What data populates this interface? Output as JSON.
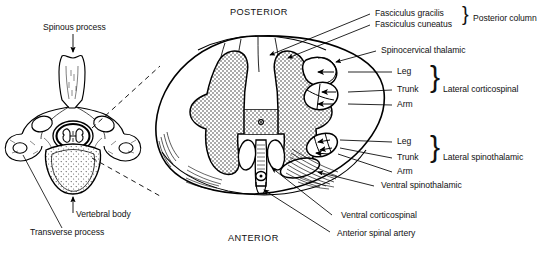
{
  "figure": {
    "title_hidden": "",
    "orientation": {
      "posterior": "POSTERIOR",
      "anterior": "ANTERIOR"
    },
    "vertebra_labels": {
      "spinous_process": "Spinous process",
      "vertebral_body": "Vertebral body",
      "transverse_process": "Transverse process"
    },
    "cord_labels": {
      "fasciculus_gracilis": "Fasciculus gracilis",
      "fasciculus_cuneatus": "Fasciculus cuneatus",
      "posterior_column": "Posterior column",
      "spinocervical_thalamic": "Spinocervical thalamic",
      "lateral_corticospinal": "Lateral corticospinal",
      "lateral_spinothalamic": "Lateral spinothalamic",
      "ventral_spinothalamic": "Ventral spinothalamic",
      "ventral_corticospinal": "Ventral corticospinal",
      "anterior_spinal_artery": "Anterior spinal artery"
    },
    "somatotopy_upper": {
      "leg": "Leg",
      "trunk": "Trunk",
      "arm": "Arm"
    },
    "somatotopy_lower": {
      "leg": "Leg",
      "trunk": "Trunk",
      "arm": "Arm"
    },
    "colors": {
      "ink": "#000000",
      "background": "#ffffff",
      "gray_matter_stipple": "#3a3a3a"
    }
  }
}
